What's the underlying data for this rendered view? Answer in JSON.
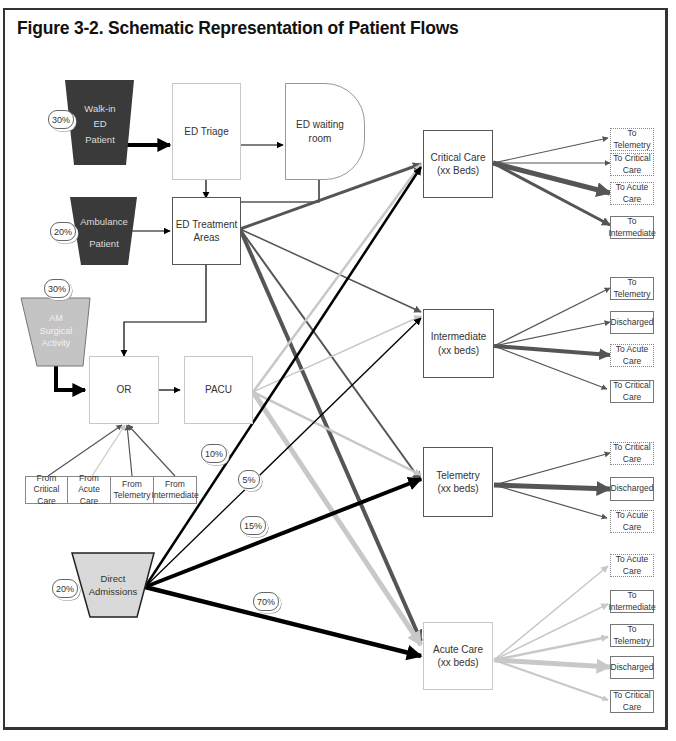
{
  "figure": {
    "title": "Figure 3-2. Schematic Representation of Patient Flows"
  },
  "sources": {
    "walk_in": {
      "line1": "Walk-in",
      "line2": "ED",
      "line3": "Patient",
      "pct": "30%"
    },
    "ambulance": {
      "line1": "Ambulance",
      "line2": "Patient",
      "pct": "20%"
    },
    "am_surgical": {
      "line1": "AM",
      "line2": "Surgical",
      "line3": "Activity",
      "pct": "30%"
    },
    "direct_admissions": {
      "line1": "Direct",
      "line2": "Admissions",
      "pct": "20%"
    }
  },
  "nodes": {
    "ed_triage": "ED Triage",
    "ed_waiting_room": "ED waiting room",
    "ed_treatment": {
      "line1": "ED Treatment",
      "line2": "Areas"
    },
    "or": "OR",
    "pacu": "PACU",
    "critical_care": {
      "line1": "Critical Care",
      "line2": "(xx Beds)"
    },
    "intermediate": {
      "line1": "Intermediate",
      "line2": "(xx beds)"
    },
    "telemetry": {
      "line1": "Telemetry",
      "line2": "(xx beds)"
    },
    "acute_care": {
      "line1": "Acute Care",
      "line2": "(xx beds)"
    }
  },
  "or_sources": [
    {
      "line1": "From Critical",
      "line2": "Care"
    },
    {
      "line1": "From Acute",
      "line2": "Care"
    },
    {
      "line1": "From",
      "line2": "Telemetry"
    },
    {
      "line1": "From",
      "line2": "Intermediate"
    }
  ],
  "direct_admission_splits": {
    "to_critical_care": "10%",
    "to_intermediate": "5%",
    "to_telemetry": "15%",
    "to_acute_care": "70%"
  },
  "outflows": {
    "critical_care": [
      {
        "line1": "To",
        "line2": "Telemetry"
      },
      {
        "line1": "To Critical",
        "line2": "Care"
      },
      {
        "line1": "To  Acute",
        "line2": "Care"
      },
      {
        "line1": "To",
        "line2": "Intermediate"
      }
    ],
    "intermediate": [
      {
        "line1": "To",
        "line2": "Telemetry"
      },
      {
        "line1": "Discharged",
        "line2": ""
      },
      {
        "line1": "To  Acute",
        "line2": "Care"
      },
      {
        "line1": "To  Critical",
        "line2": "Care"
      }
    ],
    "telemetry": [
      {
        "line1": "To  Critical",
        "line2": "Care"
      },
      {
        "line1": "Discharged",
        "line2": ""
      },
      {
        "line1": "To  Acute",
        "line2": "Care"
      }
    ],
    "acute_care": [
      {
        "line1": "To Acute",
        "line2": "Care"
      },
      {
        "line1": "To",
        "line2": "Intermediate"
      },
      {
        "line1": "To",
        "line2": "Telemetry"
      },
      {
        "line1": "Discharged",
        "line2": ""
      },
      {
        "line1": "To  Critical",
        "line2": "Care"
      }
    ]
  },
  "colors": {
    "dark_source": "#3a3a3a",
    "light_source": "#c4c4c4",
    "direct_admissions": "#d9d9d9",
    "flow_dark": "#555555",
    "flow_black": "#000000",
    "flow_light": "#c8c8c8",
    "border": "#333333"
  }
}
